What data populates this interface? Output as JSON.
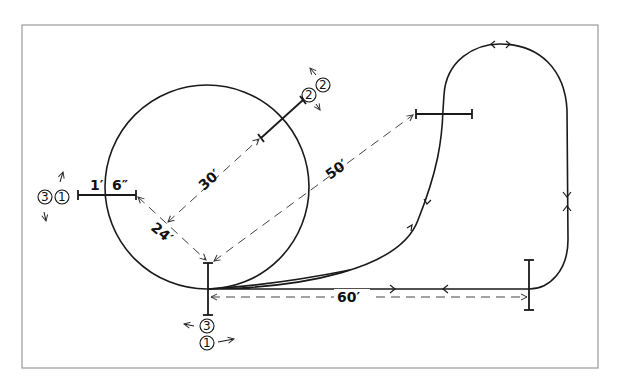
{
  "diagram": {
    "type": "course-layout",
    "frame": {
      "left": 22,
      "top": 25,
      "right": 598,
      "bottom": 368
    },
    "circle": {
      "cx": 207,
      "cy": 187,
      "r": 102
    },
    "measurements": {
      "gate_width_left": "1′",
      "gate_width_right": "6″",
      "diag_short": "24′",
      "diag_radius": "30′",
      "diag_long": "50′",
      "straight": "60′"
    },
    "positions": {
      "left_pair": [
        "3",
        "1"
      ],
      "top_pair": [
        "2",
        "2"
      ],
      "bottom_a": "3",
      "bottom_b": "1"
    }
  }
}
